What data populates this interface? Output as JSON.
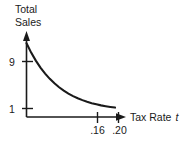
{
  "figure": {
    "background_color": "#ffffff",
    "ink_color": "#1a1a1a",
    "y_axis_title_line1": "Total",
    "y_axis_title_line2": "Sales",
    "x_axis_label_text": "Tax Rate",
    "x_axis_label_variable": "t",
    "y_tick_high": "9",
    "y_tick_low": "1",
    "x_tick_first": ".16",
    "x_tick_second": ".20"
  },
  "chart_data": {
    "type": "line",
    "title": "",
    "subtitle": "",
    "xlabel": "Tax Rate t",
    "ylabel": "Total Sales",
    "grid": false,
    "legend": null,
    "xlim": [
      0,
      0.235
    ],
    "ylim": [
      0,
      10.5
    ],
    "x_ticks": [
      0.16,
      0.2
    ],
    "x_tick_labels": [
      ".16",
      ".20"
    ],
    "y_ticks": [
      1,
      9
    ],
    "y_tick_labels": [
      "1",
      "9"
    ],
    "axis_arrows": [
      "x-right",
      "y-up"
    ],
    "series": [
      {
        "name": "Total Sales vs Tax Rate",
        "description": "Smooth exponential decay from 9 at t=0 down toward 1 near t=0.20",
        "x": [
          0.0,
          0.011,
          0.022,
          0.033,
          0.044,
          0.055,
          0.066,
          0.077,
          0.088,
          0.099,
          0.11,
          0.121,
          0.132,
          0.143,
          0.154,
          0.165,
          0.176,
          0.187,
          0.198,
          0.209
        ],
        "y": [
          9.0,
          7.86,
          6.88,
          6.03,
          5.3,
          4.66,
          4.11,
          3.63,
          3.22,
          2.86,
          2.55,
          2.29,
          2.06,
          1.86,
          1.69,
          1.55,
          1.42,
          1.32,
          1.23,
          1.15
        ]
      }
    ],
    "annotations": []
  }
}
